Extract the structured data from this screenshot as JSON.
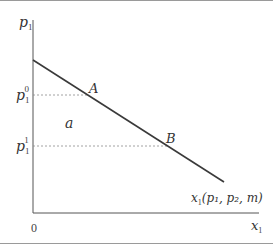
{
  "diagram": {
    "type": "demand-curve",
    "y_axis_label": "p",
    "y_axis_sub": "1",
    "x_axis_label": "x",
    "x_axis_sub": "1",
    "origin_label": "0",
    "price_levels": [
      {
        "name": "p",
        "sub": "1",
        "sup": "0"
      },
      {
        "name": "p",
        "sub": "1",
        "sup": "1"
      }
    ],
    "points": [
      {
        "label": "A"
      },
      {
        "label": "B"
      }
    ],
    "region_label": "a",
    "curve_label": "x",
    "curve_label_sub": "1",
    "curve_label_args": "(p₁, p₂, m)",
    "colors": {
      "axis": "#555555",
      "curve": "#3a3a3a",
      "dashed": "#8a8a8a",
      "frame": "#9a9a9a"
    }
  }
}
